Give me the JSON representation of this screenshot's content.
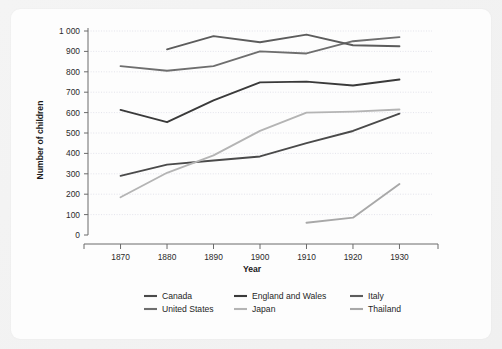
{
  "chart_data": {
    "type": "line",
    "title": "",
    "xlabel": "Year",
    "ylabel": "Number of children",
    "x": [
      1870,
      1880,
      1890,
      1900,
      1910,
      1920,
      1930
    ],
    "xtick_labels": [
      "1870",
      "1880",
      "1890",
      "1900",
      "1910",
      "1920",
      "1930"
    ],
    "xlim": [
      1863,
      1937
    ],
    "ylim": [
      0,
      1000
    ],
    "ytick_values": [
      0,
      100,
      200,
      300,
      400,
      500,
      600,
      700,
      800,
      900,
      1000
    ],
    "ytick_labels": [
      "0",
      "100",
      "200",
      "300",
      "400",
      "500",
      "600",
      "700",
      "800",
      "900",
      "1 000"
    ],
    "grid": true,
    "legend_position": "bottom",
    "series": [
      {
        "name": "Canada",
        "color": "#4a4a4a",
        "x": [
          1870,
          1880,
          1890,
          1900,
          1910,
          1920,
          1930
        ],
        "values": [
          290,
          345,
          365,
          385,
          450,
          510,
          595
        ]
      },
      {
        "name": "United States",
        "color": "#6e6e6e",
        "x": [
          1870,
          1880,
          1890,
          1900,
          1910,
          1920,
          1930
        ],
        "values": [
          828,
          805,
          828,
          900,
          890,
          950,
          970
        ]
      },
      {
        "name": "England and Wales",
        "color": "#3a3a3a",
        "x": [
          1870,
          1880,
          1890,
          1900,
          1910,
          1920,
          1930
        ],
        "values": [
          613,
          553,
          660,
          748,
          752,
          733,
          762
        ]
      },
      {
        "name": "Japan",
        "color": "#b4b4b4",
        "x": [
          1870,
          1880,
          1890,
          1900,
          1910,
          1920,
          1930
        ],
        "values": [
          185,
          305,
          390,
          510,
          600,
          605,
          615
        ]
      },
      {
        "name": "Italy",
        "color": "#5c5c5c",
        "x": [
          1880,
          1890,
          1900,
          1910,
          1920,
          1930
        ],
        "values": [
          910,
          975,
          945,
          982,
          930,
          925
        ]
      },
      {
        "name": "Thailand",
        "color": "#a8a8a8",
        "x": [
          1910,
          1920,
          1930
        ],
        "values": [
          60,
          85,
          250
        ]
      }
    ]
  },
  "legend": {
    "items": [
      {
        "label": "Canada",
        "color": "#4a4a4a"
      },
      {
        "label": "England and Wales",
        "color": "#3a3a3a"
      },
      {
        "label": "Italy",
        "color": "#5c5c5c"
      },
      {
        "label": "United States",
        "color": "#6e6e6e"
      },
      {
        "label": "Japan",
        "color": "#b4b4b4"
      },
      {
        "label": "Thailand",
        "color": "#a8a8a8"
      }
    ]
  }
}
